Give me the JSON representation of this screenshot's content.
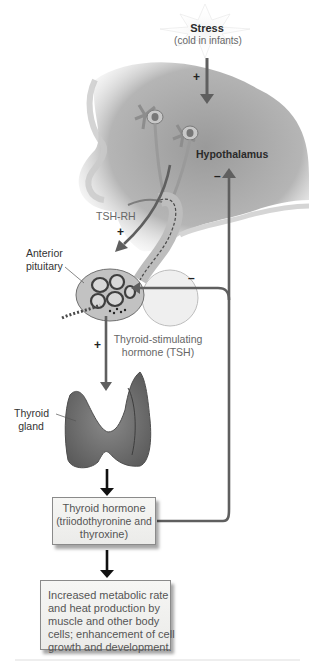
{
  "diagram": {
    "stimulus": {
      "line1": "Stress",
      "line2": "(cold in infants)"
    },
    "labels": {
      "hypothalamus": "Hypothalamus",
      "tsh_rh": "TSH-RH",
      "anterior_pituitary_line1": "Anterior",
      "anterior_pituitary_line2": "pituitary",
      "tsh_line1": "Thyroid-stimulating",
      "tsh_line2": "hormone (TSH)",
      "thyroid_line1": "Thyroid",
      "thyroid_line2": "gland"
    },
    "signs": {
      "stress_to_hypothalamus": "+",
      "tshrh_to_pituitary": "+",
      "tsh_to_thyroid": "+",
      "feedback_hypothalamus": "–",
      "feedback_pituitary": "–"
    },
    "hormone_box": {
      "line1": "Thyroid hormone",
      "line2": "(triiodothyronine and",
      "line3": "thyroxine)"
    },
    "effect_box": {
      "line1": "Increased metabolic rate",
      "line2": "and heat production by",
      "line3": "muscle and other body",
      "line4": "cells; enhancement of cell",
      "line5": "growth and development."
    },
    "colors": {
      "arrow_grey": "#5f5f5f",
      "arrow_black": "#111111",
      "tissue_grey": "#a9a9a9",
      "box_fill": "#f0f0ee",
      "box_border": "#8a8a8a"
    }
  }
}
